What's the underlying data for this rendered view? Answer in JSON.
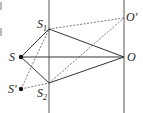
{
  "diagram": {
    "type": "optics-interference-geometry",
    "points": {
      "S": {
        "label": "S",
        "x": 21,
        "y": 57
      },
      "S1": {
        "label": "S",
        "sub": "1",
        "x": 49,
        "y": 29
      },
      "S2": {
        "label": "S",
        "sub": "2",
        "x": 49,
        "y": 83
      },
      "O": {
        "label": "O",
        "x": 124,
        "y": 57
      },
      "O_prime": {
        "label": "O'",
        "x": 124,
        "y": 18
      },
      "S_prime": {
        "label": "S'",
        "x": 21,
        "y": 89
      }
    },
    "lines": {
      "vertical_left_x": 49,
      "vertical_right_x": 124
    },
    "colors": {
      "line": "#333333",
      "dashed": "#555555",
      "background": "#ffffff"
    },
    "left_edge_marks": [
      "|",
      "|"
    ]
  }
}
